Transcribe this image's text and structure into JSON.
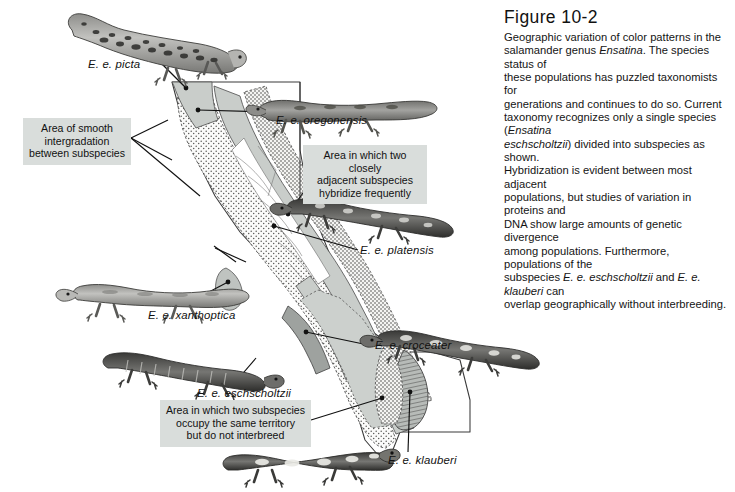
{
  "figure": {
    "title": "Figure 10-2",
    "caption_lines": [
      "Geographic variation of color patterns in the",
      "salamander genus Ensatina. The species status of",
      "these populations has puzzled taxonomists for",
      "generations and continues to do so. Current",
      "taxonomy recognizes only a single species (Ensatina",
      "eschscholtzii) divided into subspecies as shown.",
      "Hybridization is evident between most adjacent",
      "populations, but studies of variation in proteins and",
      "DNA show large amounts of genetic divergence",
      "among populations. Furthermore, populations of the",
      "subspecies E. e. eschscholtzii and E. e. klauberi can",
      "overlap geographically without interbreeding."
    ]
  },
  "callouts": [
    {
      "id": "intergradation",
      "lines": [
        "Area of smooth",
        "intergradation",
        "between subspecies"
      ]
    },
    {
      "id": "hybridize",
      "lines": [
        "Area in which two closely",
        "adjacent subspecies",
        "hybridize frequently"
      ]
    },
    {
      "id": "overlap",
      "lines": [
        "Area in which two subspecies",
        "occupy the same territory",
        "but do not interbreed"
      ]
    }
  ],
  "species_labels": [
    {
      "id": "picta",
      "text": "E. e. picta"
    },
    {
      "id": "oregonensis",
      "text": "E. e. oregonensis"
    },
    {
      "id": "platensis",
      "text": "E. e. platensis"
    },
    {
      "id": "xanthoptica",
      "text": "E. e. xanthoptica"
    },
    {
      "id": "croceater",
      "text": "E. e. croceater"
    },
    {
      "id": "eschscholtzii",
      "text": "E. e. eschscholtzii"
    },
    {
      "id": "klauberi",
      "text": "E. e. klauberi"
    }
  ],
  "colors": {
    "callout_background": "#d9dddb",
    "text": "#111111",
    "map_range_gray": "#c9cdca",
    "map_stipple": "#f2f2f0",
    "map_outline": "#3a3a3a",
    "leader_line": "#1a1a1a",
    "salamander_body": "#8d8d8a",
    "salamander_dark": "#3e3e3c",
    "page_background": "#ffffff"
  }
}
